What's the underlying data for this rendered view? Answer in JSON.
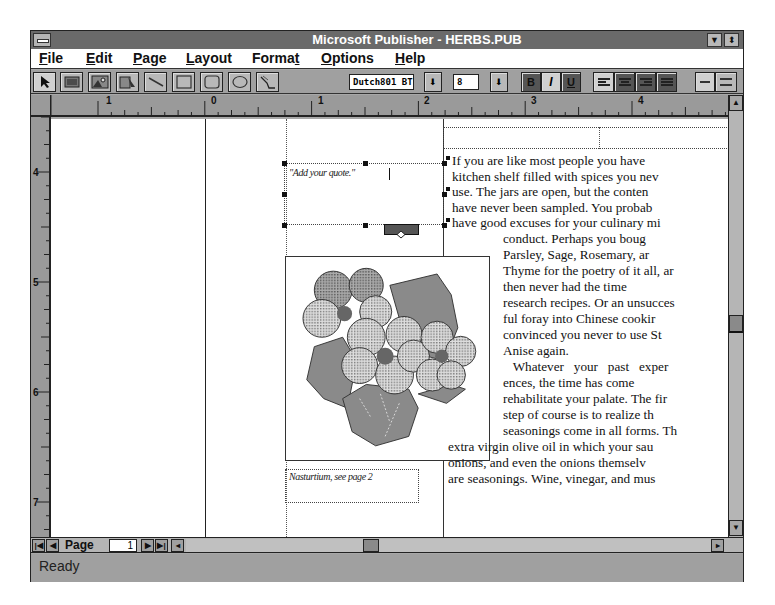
{
  "window": {
    "title": "Microsoft Publisher - HERBS.PUB",
    "minimize_icon": "down-triangle",
    "restore_icon": "up-down-triangle"
  },
  "menubar": {
    "items": [
      {
        "label": "File",
        "mnemonic": "F"
      },
      {
        "label": "Edit",
        "mnemonic": "E"
      },
      {
        "label": "Page",
        "mnemonic": "P"
      },
      {
        "label": "Layout",
        "mnemonic": "L"
      },
      {
        "label": "Format",
        "mnemonic": "t"
      },
      {
        "label": "Options",
        "mnemonic": "O"
      },
      {
        "label": "Help",
        "mnemonic": "H"
      }
    ]
  },
  "toolbar": {
    "tools": [
      "pointer",
      "text-frame",
      "picture-frame",
      "wordart",
      "line",
      "box",
      "rounded-box",
      "oval",
      "crop"
    ],
    "font_name": "Dutch801 BT",
    "font_size": "8",
    "bold": "B",
    "italic": "I",
    "underline": "U",
    "align_buttons": [
      "left",
      "center",
      "right",
      "justify"
    ],
    "spacing_buttons": [
      "single",
      "double"
    ]
  },
  "ruler": {
    "horizontal_labels": [
      "1",
      "0",
      "1",
      "2",
      "3",
      "4"
    ],
    "vertical_labels": [
      "4",
      "5",
      "6",
      "7"
    ]
  },
  "document": {
    "quote_placeholder": "\"Add your quote.\"",
    "caption": "Nasturtium, see page 2",
    "body_lines_full": [
      "If you are like most people you have",
      "kitchen shelf filled with spices you nev",
      "use. The jars are open, but the conten",
      "have never been sampled. You probab",
      "have good excuses for your culinary mi"
    ],
    "body_lines_wrapped": [
      "conduct.  Perhaps  you  boug",
      "Parsley,   Sage,   Rosemary,   ar",
      "Thyme for the poetry of it all, ar",
      "then   never   had   the   time",
      "research recipes. Or an unsucces",
      "ful  foray  into  Chinese  cookir",
      "convinced you never to use St",
      "Anise again.",
      "   Whatever   your   past   exper",
      "ences,  the  time  has  come",
      "rehabilitate your palate. The fir",
      "step  of  course  is  to  realize  th",
      "seasonings come in all forms. Th"
    ],
    "body_lines_bottom": [
      "extra virgin olive oil in which your sau",
      "onions, and even the onions themselv",
      "are seasonings. Wine, vinegar, and mus"
    ],
    "image_description": "nasturtium flowers illustration"
  },
  "navigation": {
    "page_label": "Page",
    "page_number": "1"
  },
  "status": {
    "text": "Ready"
  }
}
